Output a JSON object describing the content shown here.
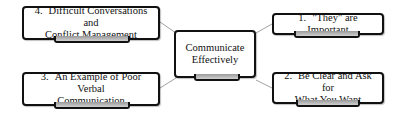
{
  "diagram": {
    "center": {
      "label": "Communicate Effectively",
      "line1": "Communicate",
      "line2": "Effectively"
    },
    "branches": [
      {
        "number": "1.",
        "line1": "\"They\" are Important",
        "line2": ""
      },
      {
        "number": "2.",
        "line1": "Be Clear and Ask for",
        "line2": "What You Want"
      },
      {
        "number": "3.",
        "line1": "An Example of Poor Verbal",
        "line2": "Communication"
      },
      {
        "number": "4.",
        "line1": "Difficult Conversations and",
        "line2": "Conflict Management"
      }
    ],
    "colors": {
      "border": "#111111",
      "connector": "#888888",
      "tab": "#a8a8a8",
      "background": "#ffffff"
    }
  }
}
